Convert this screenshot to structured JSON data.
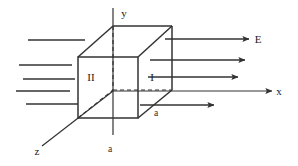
{
  "figure": {
    "title_visible": false,
    "stroke_color": "#333333",
    "background_color": "#ffffff",
    "axes": [
      {
        "name": "y",
        "label": "y",
        "label_x": 124,
        "label_y": 17,
        "orientation": "vertical"
      },
      {
        "name": "x",
        "label": "x",
        "label_x": 279,
        "label_y": 95,
        "orientation": "horizontal"
      },
      {
        "name": "z",
        "label": "z",
        "label_x": 37,
        "label_y": 155,
        "orientation": "diagonal"
      }
    ],
    "face_labels": [
      {
        "name": "face-two",
        "label": "II",
        "x": 91,
        "y": 81
      },
      {
        "name": "face-one",
        "label": "I",
        "x": 152,
        "y": 81
      }
    ],
    "dimension_labels": [
      {
        "name": "side-length-bottom",
        "label": "a",
        "x": 110,
        "y": 152
      },
      {
        "name": "side-length-right",
        "label": "a",
        "x": 156,
        "y": 116
      }
    ],
    "field_label": {
      "name": "electric-field",
      "label": "E",
      "x": 258,
      "y": 43
    },
    "incoming_field_lines": [
      {
        "x1": 28,
        "y1": 40,
        "x2": 85,
        "y2": 40
      },
      {
        "x1": 19,
        "y1": 65,
        "x2": 72,
        "y2": 65
      },
      {
        "x1": 23,
        "y1": 79,
        "x2": 75,
        "y2": 79
      },
      {
        "x1": 16,
        "y1": 91,
        "x2": 70,
        "y2": 91
      },
      {
        "x1": 26,
        "y1": 104,
        "x2": 78,
        "y2": 104
      }
    ],
    "outgoing_field_arrows": [
      {
        "x1": 165,
        "y1": 39,
        "x2": 249,
        "y2": 39
      },
      {
        "x1": 150,
        "y1": 60,
        "x2": 245,
        "y2": 60
      },
      {
        "x1": 148,
        "y1": 77,
        "x2": 238,
        "y2": 77
      },
      {
        "x1": 140,
        "y1": 105,
        "x2": 214,
        "y2": 105
      }
    ],
    "cube": {
      "front_face": {
        "left": 78,
        "top": 57,
        "right": 138,
        "bottom": 118
      },
      "back_face": {
        "left": 113,
        "top": 26,
        "right": 172,
        "bottom": 90
      },
      "solid_edges": [
        {
          "x1": 78,
          "y1": 57,
          "x2": 138,
          "y2": 57
        },
        {
          "x1": 138,
          "y1": 57,
          "x2": 138,
          "y2": 118
        },
        {
          "x1": 138,
          "y1": 118,
          "x2": 78,
          "y2": 118
        },
        {
          "x1": 78,
          "y1": 118,
          "x2": 78,
          "y2": 57
        },
        {
          "x1": 113,
          "y1": 26,
          "x2": 172,
          "y2": 26
        },
        {
          "x1": 172,
          "y1": 26,
          "x2": 172,
          "y2": 90
        },
        {
          "x1": 78,
          "y1": 57,
          "x2": 113,
          "y2": 26
        },
        {
          "x1": 138,
          "y1": 57,
          "x2": 172,
          "y2": 26
        },
        {
          "x1": 138,
          "y1": 118,
          "x2": 172,
          "y2": 90
        }
      ],
      "dashed_edges": [
        {
          "x1": 113,
          "y1": 26,
          "x2": 113,
          "y2": 90
        },
        {
          "x1": 113,
          "y1": 90,
          "x2": 172,
          "y2": 90
        },
        {
          "x1": 78,
          "y1": 118,
          "x2": 113,
          "y2": 90
        }
      ]
    },
    "axis_lines": {
      "y_axis": {
        "x1": 113,
        "y1": 8,
        "x2": 113,
        "y2": 135
      },
      "x_axis": {
        "x1": 113,
        "y1": 91,
        "x2": 272,
        "y2": 91
      },
      "z_axis": {
        "x1": 113,
        "y1": 91,
        "x2": 42,
        "y2": 146
      }
    }
  }
}
